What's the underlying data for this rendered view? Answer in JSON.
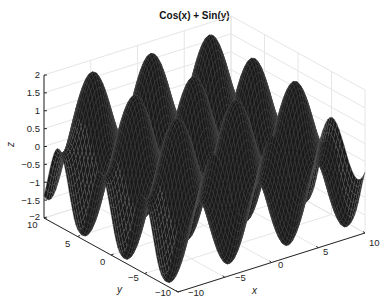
{
  "chart_data": {
    "type": "surface",
    "title": "Cos(x) + Sin(y)",
    "function": "z = cos(x) + sin(y)",
    "xlabel": "x",
    "ylabel": "y",
    "zlabel": "z",
    "xlim": [
      -10,
      10
    ],
    "ylim": [
      -10,
      10
    ],
    "zlim": [
      -2,
      2
    ],
    "x_ticks": [
      "-10",
      "-5",
      "0",
      "5",
      "10"
    ],
    "y_ticks": [
      "-10",
      "-5",
      "0",
      "5",
      "10"
    ],
    "z_ticks": [
      "-2",
      "-1.5",
      "-1",
      "-0.5",
      "0",
      "0.5",
      "1",
      "1.5",
      "2"
    ],
    "grid": true,
    "colormap": "black mesh",
    "legend": null
  },
  "title": "Cos(x) + Sin(y)",
  "labels": {
    "x": "x",
    "y": "y",
    "z": "z"
  },
  "ticks": {
    "z": [
      "2",
      "1.5",
      "1",
      "0.5",
      "0",
      "−0.5",
      "−1",
      "−1.5",
      "−2"
    ],
    "y": [
      "10",
      "5",
      "0",
      "−5",
      "−10"
    ],
    "x": [
      "−10",
      "−5",
      "0",
      "5",
      "10"
    ]
  },
  "colors": {
    "surface": "#1a1a1a",
    "mesh": "#555555",
    "axis": "#262626",
    "grid": "#e6e6e6"
  }
}
